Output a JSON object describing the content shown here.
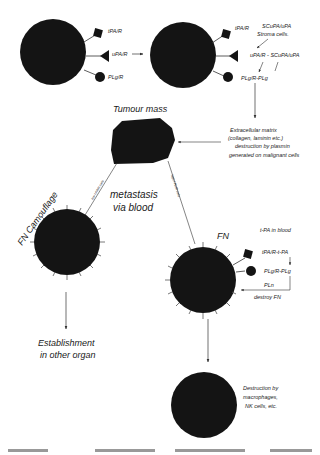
{
  "diagram": {
    "cell1": {
      "receptors": [
        "tPA/R",
        "uPA/R",
        "PLg/R"
      ]
    },
    "cell2": {
      "receptors": [
        "tPA/R",
        "uPA/R - SCuPA/uPA",
        "PLg/R-PLg"
      ]
    },
    "stroma_label": [
      "SCuPA/uPA",
      "Stroma cells."
    ],
    "tumour_label": "Tumour mass",
    "ecm_label": [
      "Extracellular matrix",
      "(collagen, laminin etc.)",
      "destruction by plasmin",
      "generated on malignant cells"
    ],
    "metastasis_label": [
      "metastasis",
      "via blood"
    ],
    "low_path_label": "low t-PA/R cells",
    "high_path_label": "high t-PA/R cells",
    "fn_camouflage_label": "FN Camouflage",
    "establishment_label": [
      "Establishment",
      "in other organ"
    ],
    "fn_label": "FN",
    "tpa_blood_label": "t-PA in blood",
    "tpa_complex_label": "tPA/R-t-PA",
    "plg_complex_label": "PLg/R-PLg",
    "pln_label": "PLn",
    "destroy_label": "destroy FN",
    "destruction_label": [
      "Destruction by",
      "macrophages,",
      "NK cells, etc."
    ],
    "caption": "...",
    "colors": {
      "cell": "#141414",
      "line": "#333333",
      "background": "#ffffff"
    }
  }
}
